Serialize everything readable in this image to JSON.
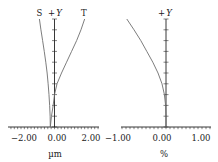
{
  "chart_data": [
    {
      "type": "line",
      "title": "Field Curves (Astigmatism)",
      "xlabel": "µm",
      "ylabel": "+Y",
      "x_ticks": [
        -2.0,
        0.0,
        2.0
      ],
      "x_tick_labels": [
        "−2.00",
        "0.00",
        "2.00"
      ],
      "xlim": [
        -2.85,
        2.6
      ],
      "ylim": [
        0,
        1
      ],
      "grid": false,
      "legend": "curve end labels at top",
      "y_axis_major_ticks": 10,
      "series": [
        {
          "name": "S",
          "y": [
            0.0,
            0.1,
            0.2,
            0.3,
            0.4,
            0.5,
            0.6,
            0.7,
            0.8,
            0.9,
            1.0
          ],
          "x": [
            -0.25,
            -0.26,
            -0.29,
            -0.33,
            -0.38,
            -0.44,
            -0.52,
            -0.61,
            -0.71,
            -0.81,
            -0.9
          ]
        },
        {
          "name": "T",
          "y": [
            0.0,
            0.1,
            0.2,
            0.3,
            0.4,
            0.5,
            0.6,
            0.7,
            0.8,
            0.9,
            1.0
          ],
          "x": [
            -0.25,
            -0.18,
            -0.08,
            0.0,
            0.15,
            0.42,
            0.72,
            1.02,
            1.32,
            1.58,
            1.8
          ]
        }
      ]
    },
    {
      "type": "line",
      "title": "Distortion",
      "xlabel": "%",
      "ylabel": "+Y",
      "x_ticks": [
        -1.0,
        0.0,
        1.0
      ],
      "x_tick_labels": [
        "−1.00",
        "0.00",
        "1.00"
      ],
      "xlim": [
        -1.1,
        1.12
      ],
      "ylim": [
        0,
        1
      ],
      "grid": false,
      "y_axis_major_ticks": 10,
      "series": [
        {
          "name": "Distortion",
          "y": [
            0.0,
            0.1,
            0.2,
            0.3,
            0.4,
            0.5,
            0.6,
            0.7,
            0.8,
            0.9,
            1.0
          ],
          "x": [
            0.0,
            0.0,
            -0.01,
            -0.04,
            -0.1,
            -0.2,
            -0.33,
            -0.48,
            -0.63,
            -0.8,
            -0.98
          ]
        }
      ]
    }
  ],
  "labels": {
    "left": {
      "s": "S",
      "y_plus": "+",
      "y_var": "Y",
      "t": "T",
      "unit": "µm"
    },
    "right": {
      "y_plus": "+",
      "y_var": "Y",
      "unit": "%"
    }
  },
  "colors": {
    "axis": "#222222",
    "curve": "#6e6e6e",
    "text": "#1a1a1a"
  }
}
